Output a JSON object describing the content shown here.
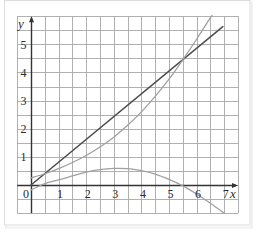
{
  "chart_data": {
    "type": "line",
    "title": "",
    "xlabel": "x",
    "ylabel": "y",
    "xlim": [
      -0.5,
      7.5
    ],
    "ylim": [
      -1,
      6
    ],
    "grid": true,
    "grid_step": 0.5,
    "legend": null,
    "origin_label": "0",
    "x_ticks": [
      1,
      2,
      3,
      4,
      5,
      6,
      7
    ],
    "y_ticks": [
      1,
      2,
      3,
      4,
      5
    ],
    "series": [
      {
        "name": "straight line",
        "color": "#4d4d4d",
        "width": 1.5,
        "points": [
          [
            0,
            0
          ],
          [
            6.95,
            5.63
          ]
        ]
      },
      {
        "name": "upper curve",
        "color": "#a0a0a0",
        "width": 1.3,
        "points": [
          [
            0,
            0.25
          ],
          [
            0.5,
            0.4
          ],
          [
            1,
            0.58
          ],
          [
            1.5,
            0.8
          ],
          [
            2,
            1.05
          ],
          [
            2.5,
            1.35
          ],
          [
            3,
            1.7
          ],
          [
            3.5,
            2.12
          ],
          [
            4,
            2.6
          ],
          [
            4.5,
            3.15
          ],
          [
            5,
            3.76
          ],
          [
            5.5,
            4.45
          ],
          [
            6,
            5.18
          ],
          [
            6.5,
            5.95
          ],
          [
            6.55,
            6.0
          ]
        ]
      },
      {
        "name": "lower curve",
        "color": "#a0a0a0",
        "width": 1.3,
        "points": [
          [
            0,
            -0.18
          ],
          [
            0.5,
            0.05
          ],
          [
            1,
            0.18
          ],
          [
            1.5,
            0.32
          ],
          [
            2,
            0.46
          ],
          [
            2.5,
            0.55
          ],
          [
            3,
            0.59
          ],
          [
            3.5,
            0.58
          ],
          [
            4,
            0.51
          ],
          [
            4.5,
            0.39
          ],
          [
            5,
            0.2
          ],
          [
            5.5,
            -0.03
          ],
          [
            6,
            -0.32
          ],
          [
            6.5,
            -0.65
          ],
          [
            7,
            -1.0
          ]
        ]
      }
    ],
    "intersections": [
      {
        "between": [
          "straight line",
          "upper curve"
        ],
        "x": 0.45,
        "y": 0.37
      },
      {
        "between": [
          "straight line",
          "upper curve"
        ],
        "x": 5.5,
        "y": 4.46
      }
    ]
  },
  "colors": {
    "grid": "#a8a8a8",
    "axis": "#333333",
    "frame": "#d9d9d9"
  }
}
